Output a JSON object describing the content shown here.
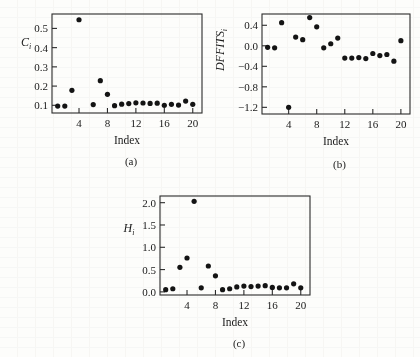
{
  "figure": {
    "background_color": "#fdfdfb",
    "point_color": "#141414",
    "axis_color": "#2b2b2b"
  },
  "panels": [
    {
      "caption": "(a)",
      "xlabel": "Index",
      "ylabel_main": "C",
      "ylabel_sub": "i"
    },
    {
      "caption": "(b)",
      "xlabel": "Index",
      "ylabel_main": "DFFITS",
      "ylabel_sub": "i"
    },
    {
      "caption": "(c)",
      "xlabel": "Index",
      "ylabel_main": "H",
      "ylabel_sub": "i"
    }
  ],
  "chart_data": [
    {
      "type": "scatter",
      "panel": "(a)",
      "title": "",
      "xlabel": "Index",
      "ylabel": "C_i",
      "xlim": [
        0.2,
        21.3
      ],
      "ylim": [
        0.06,
        0.575
      ],
      "xticks": [
        4,
        8,
        12,
        16,
        20
      ],
      "xticklabels": [
        "4",
        "8",
        "12",
        "16",
        "20"
      ],
      "yticks": [
        0.1,
        0.2,
        0.3,
        0.4,
        0.5
      ],
      "yticklabels": [
        "0.1",
        "0.2",
        "0.3",
        "0.4",
        "0.5"
      ],
      "grid": false,
      "legend": null,
      "x": [
        1,
        2,
        3,
        4,
        5,
        6,
        7,
        8,
        9,
        10,
        11,
        12,
        13,
        14,
        15,
        16,
        17,
        18,
        19,
        20
      ],
      "values": [
        0.096,
        0.096,
        0.178,
        0.545,
        null,
        0.104,
        0.228,
        0.157,
        0.098,
        0.106,
        0.109,
        0.113,
        0.112,
        0.11,
        0.111,
        0.1,
        0.105,
        0.101,
        0.122,
        0.105
      ]
    },
    {
      "type": "scatter",
      "panel": "(b)",
      "title": "",
      "xlabel": "Index",
      "ylabel": "DFFITS_i",
      "xlim": [
        0.2,
        21.3
      ],
      "ylim": [
        -1.33,
        0.62
      ],
      "xticks": [
        4,
        8,
        12,
        16,
        20
      ],
      "xticklabels": [
        "4",
        "8",
        "12",
        "16",
        "20"
      ],
      "yticks": [
        0.4,
        0.0,
        -0.4,
        -0.8,
        -1.2
      ],
      "yticklabels": [
        "0.4",
        "0.0",
        "-0.4",
        "-0.8",
        "-1.2"
      ],
      "grid": false,
      "legend": null,
      "x": [
        1,
        2,
        3,
        4,
        5,
        6,
        7,
        8,
        9,
        10,
        11,
        12,
        13,
        14,
        15,
        16,
        17,
        18,
        19,
        20
      ],
      "values": [
        -0.03,
        -0.04,
        0.45,
        -1.2,
        0.17,
        0.12,
        0.55,
        0.37,
        -0.04,
        0.04,
        0.15,
        -0.24,
        -0.24,
        -0.23,
        -0.25,
        -0.15,
        -0.19,
        -0.17,
        -0.3,
        0.1
      ]
    },
    {
      "type": "scatter",
      "panel": "(c)",
      "title": "",
      "xlabel": "Index",
      "ylabel": "H_i",
      "xlim": [
        0.2,
        21.3
      ],
      "ylim": [
        -0.07,
        2.15
      ],
      "xticks": [
        4,
        8,
        12,
        16,
        20
      ],
      "xticklabels": [
        "4",
        "8",
        "12",
        "16",
        "20"
      ],
      "yticks": [
        0.0,
        0.5,
        1.0,
        1.5,
        2.0
      ],
      "yticklabels": [
        "0.0",
        "0.5",
        "1.0",
        "1.5",
        "2.0"
      ],
      "grid": false,
      "legend": null,
      "x": [
        1,
        2,
        3,
        4,
        5,
        6,
        7,
        8,
        9,
        10,
        11,
        12,
        13,
        14,
        15,
        16,
        17,
        18,
        19,
        20
      ],
      "values": [
        0.05,
        0.07,
        0.55,
        0.76,
        2.03,
        0.09,
        0.58,
        0.36,
        0.05,
        0.07,
        0.11,
        0.13,
        0.12,
        0.13,
        0.14,
        0.1,
        0.09,
        0.09,
        0.18,
        0.09
      ]
    }
  ]
}
